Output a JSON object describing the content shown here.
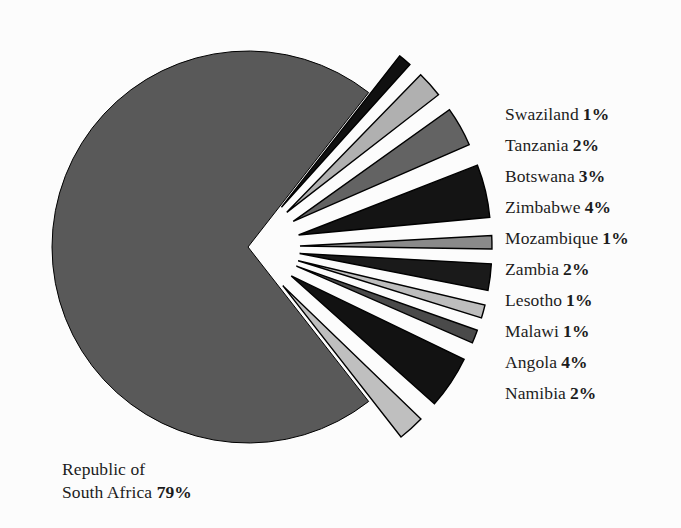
{
  "chart_data": {
    "type": "pie",
    "title": "",
    "subtitle": "",
    "xlabel": "",
    "ylabel": "",
    "legend_position": "right",
    "grid": false,
    "exploded": true,
    "units": "percent",
    "categories": [
      "Republic of South Africa",
      "Swaziland",
      "Tanzania",
      "Botswana",
      "Zimbabwe",
      "Mozambique",
      "Zambia",
      "Lesotho",
      "Malawi",
      "Angola",
      "Namibia"
    ],
    "values": [
      79,
      1,
      2,
      3,
      4,
      1,
      2,
      1,
      1,
      4,
      2
    ],
    "slices": [
      {
        "name": "Republic of South Africa",
        "value": 79,
        "label": "79%",
        "color": "#595959",
        "exploded": false
      },
      {
        "name": "Swaziland",
        "value": 1,
        "label": "1%",
        "color": "#101010",
        "exploded": true
      },
      {
        "name": "Tanzania",
        "value": 2,
        "label": "2%",
        "color": "#b0b0b0",
        "exploded": true
      },
      {
        "name": "Botswana",
        "value": 3,
        "label": "3%",
        "color": "#636363",
        "exploded": true
      },
      {
        "name": "Zimbabwe",
        "value": 4,
        "label": "4%",
        "color": "#141414",
        "exploded": true
      },
      {
        "name": "Mozambique",
        "value": 1,
        "label": "1%",
        "color": "#8a8a8a",
        "exploded": true
      },
      {
        "name": "Zambia",
        "value": 2,
        "label": "2%",
        "color": "#1a1a1a",
        "exploded": true
      },
      {
        "name": "Lesotho",
        "value": 1,
        "label": "1%",
        "color": "#bdbdbd",
        "exploded": true
      },
      {
        "name": "Malawi",
        "value": 1,
        "label": "1%",
        "color": "#4a4a4a",
        "exploded": true
      },
      {
        "name": "Angola",
        "value": 4,
        "label": "4%",
        "color": "#121212",
        "exploded": true
      },
      {
        "name": "Namibia",
        "value": 2,
        "label": "2%",
        "color": "#bfbfbf",
        "exploded": true
      }
    ],
    "colors": {
      "background": "#fcfcfc",
      "main_slice": "#595959",
      "outline": "#000000",
      "text": "#1c1c1c"
    }
  },
  "legend": {
    "items": [
      {
        "label": "Swaziland",
        "value": "1%"
      },
      {
        "label": "Tanzania",
        "value": "2%"
      },
      {
        "label": "Botswana",
        "value": "3%"
      },
      {
        "label": "Zimbabwe",
        "value": "4%"
      },
      {
        "label": "Mozambique",
        "value": "1%"
      },
      {
        "label": "Zambia",
        "value": "2%"
      },
      {
        "label": "Lesotho",
        "value": "1%"
      },
      {
        "label": "Malawi",
        "value": "1%"
      },
      {
        "label": "Angola",
        "value": "4%"
      },
      {
        "label": "Namibia",
        "value": "2%"
      }
    ]
  },
  "main_label": {
    "line1": "Republic of",
    "line2": "South Africa",
    "value": "79%"
  }
}
